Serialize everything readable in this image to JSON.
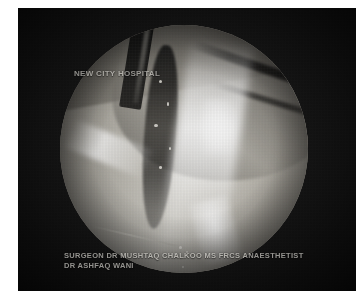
{
  "image": {
    "kind": "endoscopic-surgical-video-frame",
    "frame_background_color": "#151515",
    "page_background_color": "#ffffff",
    "overlay_text_color": "#d8d6d0"
  },
  "overlays": {
    "hospital_name": "NEW CITY HOSPITAL",
    "surgeon_line": "SURGEON DR MUSHTAQ CHALKOO   MS   FRCS  ANAESTHETIST",
    "assistant_line": "DR ASHFAQ WANI"
  },
  "scene": {
    "field_of_view_shape": "circle",
    "instrument_label": "instrument-shaft",
    "tissue_label": "tissue-plane",
    "glare_label": "specular-highlight"
  }
}
